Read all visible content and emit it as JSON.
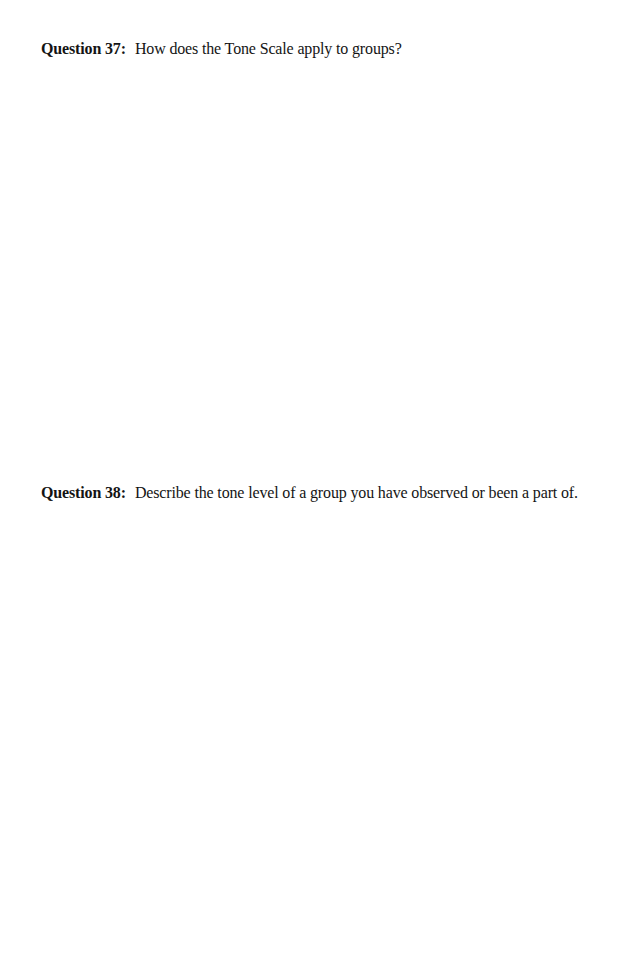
{
  "document": {
    "questions": [
      {
        "label": "Question 37:",
        "text": "How does the Tone Scale apply to groups?",
        "answer": ""
      },
      {
        "label": "Question 38:",
        "text": "Describe the tone level of a group you have observed or been a part of.",
        "answer": ""
      }
    ]
  }
}
